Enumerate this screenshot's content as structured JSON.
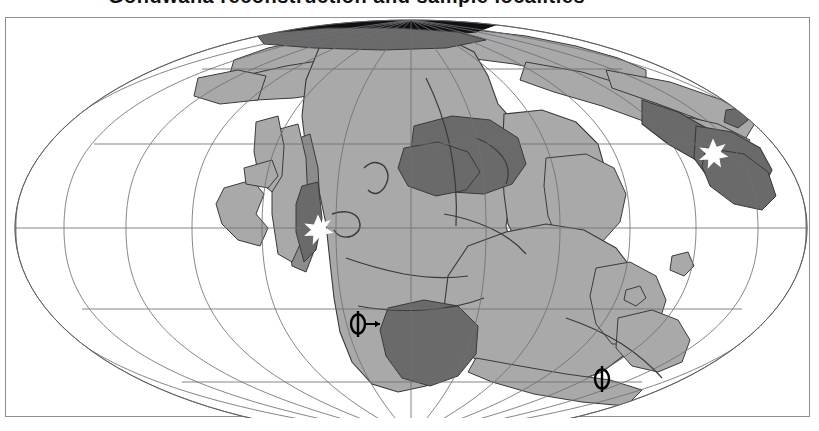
{
  "figure": {
    "type": "paleogeographic-reconstruction-map",
    "title_cropped": "Gondwana reconstruction and sample localities",
    "projection": "Mollweide / elliptical globe",
    "frame": {
      "x": 5,
      "y": 17,
      "width": 805,
      "height": 400,
      "border_color": "#8f8f8f"
    },
    "globe": {
      "center_x": 410,
      "center_y": 227,
      "radius_x": 396,
      "radius_y": 208
    }
  },
  "colors": {
    "background": "#ffffff",
    "ocean": "#ffffff",
    "land_light": "#a9a9a9",
    "land_mid": "#8c8c8c",
    "land_dark": "#6a6a6a",
    "land_black": "#101010",
    "graticule": "#6f6f78",
    "coastline": "#3a3a3a",
    "marker_white": "#ffffff",
    "marker_black": "#000000"
  },
  "graticule": {
    "visible": true,
    "latitude_lines_y": [
      68,
      143,
      227,
      308,
      381
    ],
    "longitude_count": 13,
    "line_width": 0.8
  },
  "markers": [
    {
      "id": "star-west",
      "glyph": "star",
      "symbol": "✳",
      "x": 317,
      "y": 224,
      "fill": "white",
      "label": ""
    },
    {
      "id": "star-east",
      "glyph": "star",
      "symbol": "✳",
      "x": 712,
      "y": 148,
      "fill": "white",
      "label": ""
    },
    {
      "id": "phi-left",
      "glyph": "phi-arrow",
      "symbol": "ϕ",
      "x": 357,
      "y": 323,
      "fill": "black",
      "label": ""
    },
    {
      "id": "phi-right",
      "glyph": "phi",
      "symbol": "ϕ",
      "x": 601,
      "y": 378,
      "fill": "black",
      "label": ""
    }
  ],
  "land_units": [
    {
      "name": "north-polar-cap",
      "shade": "land_black"
    },
    {
      "name": "laurasia-margin",
      "shade": "land_light"
    },
    {
      "name": "africa-craton",
      "shade": "land_light"
    },
    {
      "name": "arabia-india-block",
      "shade": "land_dark"
    },
    {
      "name": "southern-africa-basin",
      "shade": "land_dark"
    },
    {
      "name": "south-america-margin",
      "shade": "land_mid"
    },
    {
      "name": "antarctica-australia",
      "shade": "land_light"
    },
    {
      "name": "east-terrane",
      "shade": "land_dark"
    }
  ]
}
